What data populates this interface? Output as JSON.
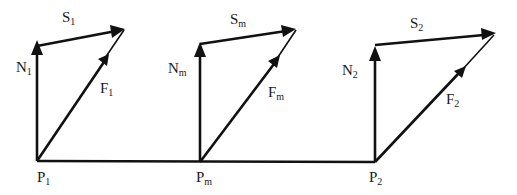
{
  "diagram": {
    "type": "vector-force-diagram",
    "groups": [
      {
        "point": {
          "base": "P",
          "sub": "1"
        },
        "normal": {
          "base": "N",
          "sub": "1"
        },
        "shear": {
          "base": "S",
          "sub": "1"
        },
        "force": {
          "base": "F",
          "sub": "1"
        }
      },
      {
        "point": {
          "base": "P",
          "sub": "m"
        },
        "normal": {
          "base": "N",
          "sub": "m"
        },
        "shear": {
          "base": "S",
          "sub": "m"
        },
        "force": {
          "base": "F",
          "sub": "m"
        }
      },
      {
        "point": {
          "base": "P",
          "sub": "2"
        },
        "normal": {
          "base": "N",
          "sub": "2"
        },
        "shear": {
          "base": "S",
          "sub": "2"
        },
        "force": {
          "base": "F",
          "sub": "2"
        }
      }
    ]
  }
}
